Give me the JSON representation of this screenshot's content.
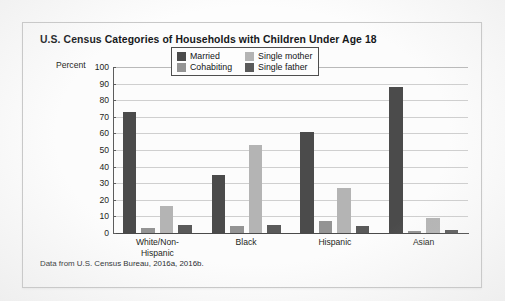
{
  "card": {
    "title": "U.S. Census Categories of Households with Children Under Age 18",
    "source_note": "Data from U.S. Census Bureau, 2016a, 2016b."
  },
  "chart_data": {
    "type": "bar",
    "title": "U.S. Census Categories of Households with Children Under Age 18",
    "xlabel": "",
    "ylabel": "Percent",
    "ylim": [
      0,
      100
    ],
    "ytick_step": 10,
    "yticks": [
      100,
      90,
      80,
      70,
      60,
      50,
      40,
      30,
      20,
      10,
      0
    ],
    "grid": true,
    "legend_position": "top-center",
    "categories": [
      "White/Non-Hispanic",
      "Black",
      "Hispanic",
      "Asian"
    ],
    "category_lines": [
      [
        "White/Non-",
        "Hispanic"
      ],
      [
        "Black"
      ],
      [
        "Hispanic"
      ],
      [
        "Asian"
      ]
    ],
    "series": [
      {
        "name": "Married",
        "color": "#4b4b4b",
        "values": [
          73,
          35,
          61,
          88
        ]
      },
      {
        "name": "Cohabiting",
        "color": "#949494",
        "values": [
          3,
          4,
          7,
          1
        ]
      },
      {
        "name": "Single mother",
        "color": "#b4b4b4",
        "values": [
          16,
          53,
          27,
          9
        ]
      },
      {
        "name": "Single father",
        "color": "#5a5a5a",
        "values": [
          5,
          5,
          4,
          2
        ]
      }
    ],
    "legend_order": [
      "Married",
      "Single mother",
      "Cohabiting",
      "Single father"
    ]
  }
}
